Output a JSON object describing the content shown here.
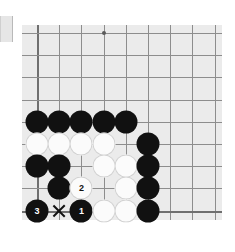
{
  "diagram": {
    "type": "go-board-diagram",
    "board_size": 19,
    "view": "bottom-left-corner",
    "visible_cols": 10,
    "visible_rows": 9,
    "colors": {
      "board": "#ebebeb",
      "page": "#ffffff",
      "grid_line": "#8d8d8d",
      "edge_line": "#6f6f6f",
      "black_stone": "#111111",
      "white_stone": "#fbfbfb",
      "mark": "#111111"
    },
    "geometry": {
      "board_left": 22,
      "board_top": 25,
      "board_width": 200,
      "board_height": 195,
      "origin_x": 15,
      "origin_y": 8,
      "cell": 22.2,
      "stone_diameter": 23
    },
    "star_points": [
      {
        "col": 3,
        "row": 0
      },
      {
        "col": 9,
        "row": 0
      },
      {
        "col": 9,
        "row": 6
      }
    ],
    "stones": [
      {
        "col": 0,
        "row": 4,
        "color": "black",
        "label": ""
      },
      {
        "col": 1,
        "row": 4,
        "color": "black",
        "label": ""
      },
      {
        "col": 2,
        "row": 4,
        "color": "black",
        "label": ""
      },
      {
        "col": 3,
        "row": 4,
        "color": "black",
        "label": ""
      },
      {
        "col": 4,
        "row": 4,
        "color": "black",
        "label": ""
      },
      {
        "col": 0,
        "row": 5,
        "color": "white",
        "label": ""
      },
      {
        "col": 1,
        "row": 5,
        "color": "white",
        "label": ""
      },
      {
        "col": 2,
        "row": 5,
        "color": "white",
        "label": ""
      },
      {
        "col": 3,
        "row": 5,
        "color": "white",
        "label": ""
      },
      {
        "col": 5,
        "row": 5,
        "color": "black",
        "label": ""
      },
      {
        "col": 0,
        "row": 6,
        "color": "black",
        "label": ""
      },
      {
        "col": 1,
        "row": 6,
        "color": "black",
        "label": ""
      },
      {
        "col": 3,
        "row": 6,
        "color": "white",
        "label": ""
      },
      {
        "col": 4,
        "row": 6,
        "color": "white",
        "label": ""
      },
      {
        "col": 5,
        "row": 6,
        "color": "black",
        "label": ""
      },
      {
        "col": 1,
        "row": 7,
        "color": "black",
        "label": ""
      },
      {
        "col": 2,
        "row": 7,
        "color": "white",
        "label": "2"
      },
      {
        "col": 4,
        "row": 7,
        "color": "white",
        "label": ""
      },
      {
        "col": 5,
        "row": 7,
        "color": "black",
        "label": ""
      },
      {
        "col": 0,
        "row": 8,
        "color": "black",
        "label": "3"
      },
      {
        "col": 2,
        "row": 8,
        "color": "black",
        "label": "1"
      },
      {
        "col": 3,
        "row": 8,
        "color": "white",
        "label": ""
      },
      {
        "col": 4,
        "row": 8,
        "color": "white",
        "label": ""
      },
      {
        "col": 5,
        "row": 8,
        "color": "black",
        "label": ""
      }
    ],
    "marks": [
      {
        "col": 1,
        "row": 8,
        "symbol": "X",
        "name": "x-mark"
      }
    ],
    "move_sequence": [
      {
        "number": "1",
        "color": "black"
      },
      {
        "number": "2",
        "color": "white"
      },
      {
        "number": "3",
        "color": "black"
      }
    ]
  }
}
